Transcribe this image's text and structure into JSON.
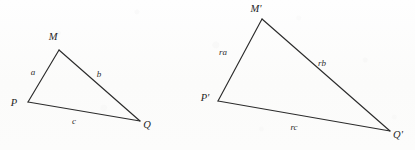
{
  "figure": {
    "background_color": "#fdfdfc",
    "stroke_color": "#2b2b2b",
    "label_color": "#262626",
    "canvas": {
      "width": 415,
      "height": 150
    }
  },
  "diagram_data": {
    "type": "geometry-similar-triangles",
    "shapes": [
      {
        "id": "triangle-original",
        "name": "triangle-PMQ",
        "vertices": [
          {
            "key": "M",
            "label": "M",
            "x": 59,
            "y": 50,
            "label_x": 53,
            "label_y": 40
          },
          {
            "key": "P",
            "label": "P",
            "x": 28,
            "y": 102,
            "label_x": 14,
            "label_y": 106
          },
          {
            "key": "Q",
            "label": "Q",
            "x": 140,
            "y": 121,
            "label_x": 145,
            "label_y": 128
          }
        ],
        "edges": [
          {
            "key": "a",
            "label": "a",
            "from": "P",
            "to": "M",
            "label_x": 33,
            "label_y": 75
          },
          {
            "key": "b",
            "label": "b",
            "from": "M",
            "to": "Q",
            "label_x": 99,
            "label_y": 77
          },
          {
            "key": "c",
            "label": "c",
            "from": "P",
            "to": "Q",
            "label_x": 74,
            "label_y": 124
          }
        ]
      },
      {
        "id": "triangle-scaled",
        "name": "triangle-P-prime-M-prime-Q-prime",
        "vertices": [
          {
            "key": "Mp",
            "label": "M'",
            "x": 262,
            "y": 19,
            "label_x": 254,
            "label_y": 12
          },
          {
            "key": "Pp",
            "label": "P'",
            "x": 218,
            "y": 101,
            "label_x": 203,
            "label_y": 101
          },
          {
            "key": "Qp",
            "label": "Q'",
            "x": 390,
            "y": 131,
            "label_x": 394,
            "label_y": 138
          }
        ],
        "edges": [
          {
            "key": "ra",
            "label": "ra",
            "from": "Pp",
            "to": "Mp",
            "label_x": 223,
            "label_y": 55
          },
          {
            "key": "rb",
            "label": "rb",
            "from": "Mp",
            "to": "Qp",
            "label_x": 322,
            "label_y": 66
          },
          {
            "key": "rc",
            "label": "rc",
            "from": "Pp",
            "to": "Qp",
            "label_x": 294,
            "label_y": 130
          }
        ]
      }
    ]
  }
}
